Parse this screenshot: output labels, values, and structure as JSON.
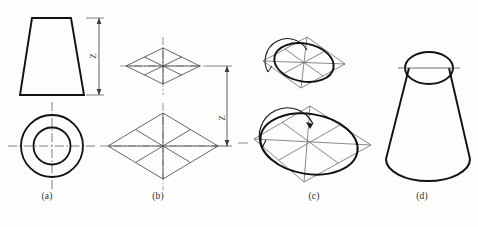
{
  "figure": {
    "background_color": "#fdfdfc",
    "line_color": "#1a1a1a",
    "construction_line_color": "#555555",
    "center_line_color": "#5a5a5a",
    "captions": [
      {
        "id": "a",
        "label": "(a)",
        "description": "Orthographic front view trapezoid and top view concentric circles"
      },
      {
        "id": "b",
        "label": "(b)",
        "description": "Isometric enclosing rhombus construction boxes for top and bottom circles"
      },
      {
        "id": "c",
        "label": "(c)",
        "description": "Four-center approximate ellipses drawn inside each rhombus"
      },
      {
        "id": "d",
        "label": "(d)",
        "description": "Completed isometric view of the cone frustum"
      }
    ],
    "dimensions": [
      {
        "id": "z-a",
        "label": "Z",
        "orientation": "vertical",
        "view": "front-view-height"
      },
      {
        "id": "z-b",
        "label": "Z",
        "orientation": "vertical",
        "view": "isometric-height"
      }
    ],
    "parts": {
      "front_view": "trapezoid",
      "top_view": "concentric-circles",
      "small_rhombus": "top-circle-isometric-box",
      "large_rhombus": "bottom-circle-isometric-box",
      "small_ellipse": "top-circle-isometric-ellipse",
      "large_ellipse": "bottom-circle-isometric-ellipse",
      "finished_solid": "cone-frustum"
    }
  }
}
